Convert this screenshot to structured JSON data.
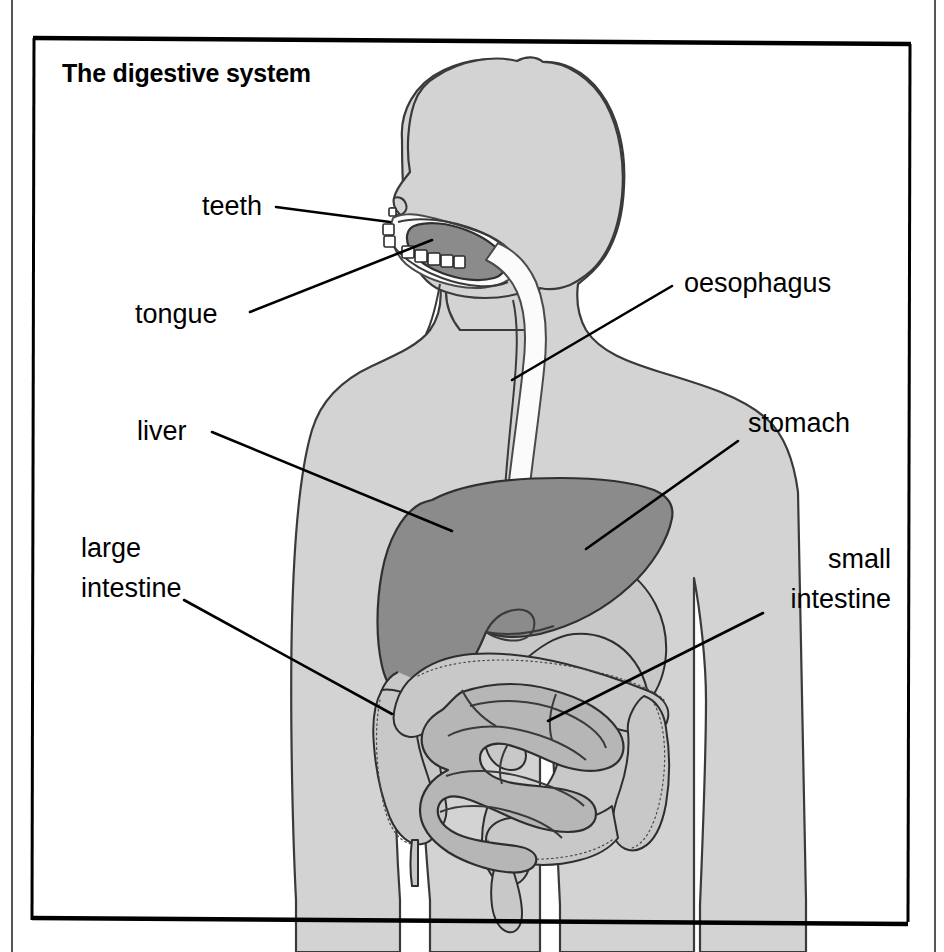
{
  "figure": {
    "title": "The digestive system",
    "kind": "anatomical-diagram",
    "orientation": "head-in-profile-facing-left, body-frontal"
  },
  "colors": {
    "background": "#ffffff",
    "body_silhouette": "#d3d3d3",
    "liver": "#8b8b8b",
    "tongue": "#8b8b8b",
    "small_intestine": "#b6b6b6",
    "large_intestine": "#c8c8c8",
    "oesophagus": "#fbfbfb",
    "teeth": "#ffffff",
    "outline": "#3a3a3a",
    "text": "#000000",
    "frame": "#000000"
  },
  "frame": {
    "border_label": "diagram-frame",
    "page_edge_left_label": "page-edge-left",
    "page_edge_right_label": "page-edge-right"
  },
  "labels": [
    {
      "id": "teeth",
      "text": "teeth",
      "lines": [
        "teeth"
      ],
      "align": "end",
      "text_x": 262,
      "text_y": 215,
      "leader": "M 276,207 L 390,222"
    },
    {
      "id": "tongue",
      "text": "tongue",
      "lines": [
        "tongue"
      ],
      "align": "start",
      "text_x": 135,
      "text_y": 323,
      "leader": "M 250,312 L 432,240"
    },
    {
      "id": "oesophagus",
      "text": "oesophagus",
      "lines": [
        "oesophagus"
      ],
      "align": "start",
      "text_x": 684,
      "text_y": 292,
      "leader": "M 672,286 L 512,380"
    },
    {
      "id": "stomach",
      "text": "stomach",
      "lines": [
        "stomach"
      ],
      "align": "start",
      "text_x": 748,
      "text_y": 432,
      "leader": "M 738,441 L 586,549"
    },
    {
      "id": "liver",
      "text": "liver",
      "lines": [
        "liver"
      ],
      "align": "start",
      "text_x": 137,
      "text_y": 440,
      "leader": "M 212,432 L 452,531"
    },
    {
      "id": "large-intestine",
      "text": "large intestine",
      "lines": [
        "large",
        "intestine"
      ],
      "align": "start",
      "text_x": 81,
      "text_y": 557,
      "leader": "M 184,600 L 392,714"
    },
    {
      "id": "small-intestine",
      "text": "small intestine",
      "lines": [
        "small",
        "intestine"
      ],
      "align": "end",
      "text_x": 891,
      "text_y": 568,
      "leader": "M 763,613 L 548,721"
    }
  ],
  "organs": [
    {
      "id": "teeth",
      "name": "teeth"
    },
    {
      "id": "tongue",
      "name": "tongue"
    },
    {
      "id": "oesophagus",
      "name": "oesophagus"
    },
    {
      "id": "stomach",
      "name": "stomach"
    },
    {
      "id": "liver",
      "name": "liver"
    },
    {
      "id": "large-intestine",
      "name": "large intestine"
    },
    {
      "id": "small-intestine",
      "name": "small intestine"
    }
  ]
}
